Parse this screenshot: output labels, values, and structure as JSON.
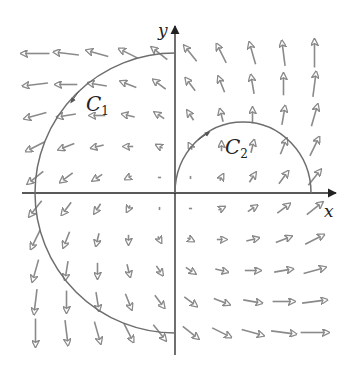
{
  "figure": {
    "type": "vector-field-with-curves",
    "field": "F(x,y) = <x - y, x + y>",
    "origin_px": [
      175,
      193
    ],
    "unit_px": 31,
    "arrow_scale": 3.1,
    "grid_values": [
      -4.5,
      -3.5,
      -2.5,
      -1.5,
      -0.5,
      0.5,
      1.5,
      2.5,
      3.5,
      4.5
    ],
    "colors": {
      "axis": "#222222",
      "curve": "#6e6e6e",
      "arrow": "#8a8a8a",
      "background": "#ffffff"
    }
  },
  "axes": {
    "x_label": "x",
    "y_label": "y"
  },
  "curves": [
    {
      "name": "C1",
      "label_main": "C",
      "label_sub": "1",
      "shape": "left semicircle",
      "center": [
        0,
        0
      ],
      "radius": 4.5,
      "direction": "counterclockwise (top to bottom along left side)"
    },
    {
      "name": "C2",
      "label_main": "C",
      "label_sub": "2",
      "shape": "upper semicircle",
      "center": [
        2.2,
        0
      ],
      "radius": 2.2,
      "direction": "clockwise (from origin over the top to x≈4.4)"
    }
  ]
}
